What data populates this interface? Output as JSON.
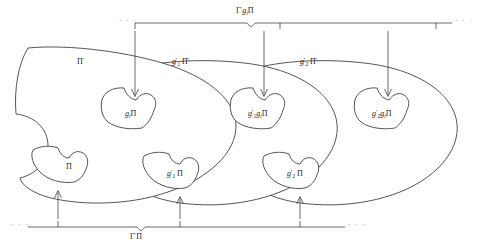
{
  "figure": {
    "type": "mathematical-set-diagram",
    "background_color": "#ffffff",
    "stroke_color": "#2b2b2b"
  },
  "brackets": {
    "top": {
      "label": "Γ′gᵢΠ",
      "label_gamma": "Γ",
      "label_prime": "′",
      "label_g": "g",
      "label_g_sub": "i",
      "label_pi": "Π",
      "leading_dots": "· · ·",
      "trailing_dots": "· · ·",
      "tick_count": 3
    },
    "bottom": {
      "label": "Γ′Π",
      "label_gamma": "Γ",
      "label_prime": "′",
      "label_pi": "Π",
      "leading_dots": "· · ·",
      "trailing_dots": "· · ·",
      "tick_count": 3
    }
  },
  "regions": [
    {
      "id": "region-1",
      "label_main": "Π",
      "label_prime": "′",
      "label_prefix": "",
      "label_prefix_sub": "",
      "full_label": "Π′"
    },
    {
      "id": "region-2",
      "label_main": "Π",
      "label_prime": "′",
      "label_prefix": "g",
      "label_prefix_sub": "1",
      "full_label": "g′₁Π′"
    },
    {
      "id": "region-3",
      "label_main": "Π",
      "label_prime": "′",
      "label_prefix": "g",
      "label_prefix_sub": "2",
      "full_label": "g′₂Π′"
    }
  ],
  "upper_blobs": [
    {
      "id": "upper-blob-1",
      "full_label": "gᵢΠ",
      "prefix": "g",
      "prefix_sub": "i",
      "prefix_prime": "",
      "second": "",
      "second_sub": "",
      "pi": "Π"
    },
    {
      "id": "upper-blob-2",
      "full_label": "g′₁gᵢΠ",
      "prefix": "g",
      "prefix_sub": "1",
      "prefix_prime": "′",
      "second": "g",
      "second_sub": "i",
      "pi": "Π"
    },
    {
      "id": "upper-blob-3",
      "full_label": "g′₂gᵢΠ",
      "prefix": "g",
      "prefix_sub": "2",
      "prefix_prime": "′",
      "second": "g",
      "second_sub": "i",
      "pi": "Π"
    }
  ],
  "lower_blobs": [
    {
      "id": "lower-blob-1",
      "full_label": "Π",
      "prefix": "",
      "prefix_sub": "",
      "prefix_prime": "",
      "pi": "Π"
    },
    {
      "id": "lower-blob-2",
      "full_label": "g′₁Π",
      "prefix": "g",
      "prefix_sub": "1",
      "prefix_prime": "′",
      "pi": "Π"
    },
    {
      "id": "lower-blob-3",
      "full_label": "g′₂Π",
      "prefix": "g",
      "prefix_sub": "2",
      "prefix_prime": "′",
      "pi": "Π"
    }
  ],
  "arrows": {
    "downward_count": 3,
    "upward_count": 3,
    "direction_down": "down",
    "direction_up": "up"
  }
}
